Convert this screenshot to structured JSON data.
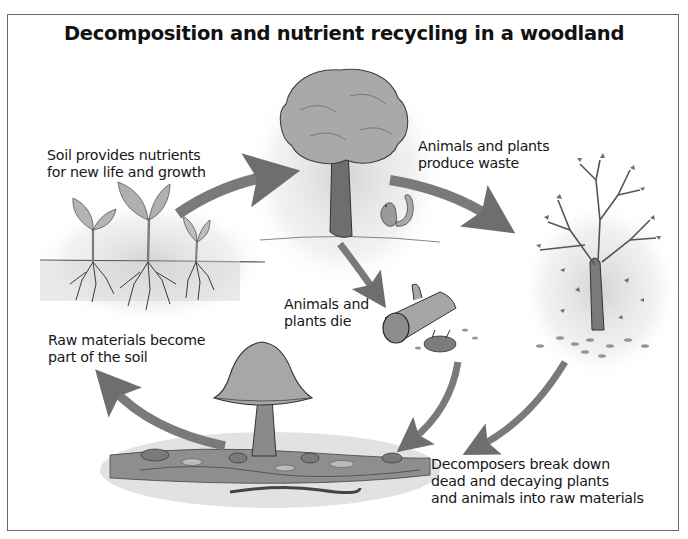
{
  "diagram": {
    "title": "Decomposition and nutrient recycling in a woodland",
    "stages": [
      {
        "id": "soil-nutrients",
        "lines": [
          "Soil provides nutrients",
          "for new life and growth"
        ],
        "illustration": "seedlings-with-roots"
      },
      {
        "id": "produce-waste",
        "lines": [
          "Animals and plants",
          "produce waste"
        ],
        "illustration": "leafy-tree-with-squirrel"
      },
      {
        "id": "die",
        "lines": [
          "Animals and",
          "plants die"
        ],
        "illustration": "fallen-log-with-dead-hedgehog"
      },
      {
        "id": "raw-materials",
        "lines": [
          "Raw materials become",
          "part of the soil"
        ],
        "illustration": "mushroom-on-forest-floor"
      },
      {
        "id": "decomposers",
        "lines": [
          "Decomposers break down",
          "dead and decaying plants",
          "and animals into raw materials"
        ],
        "illustration": "woodlice-and-worms-in-leaf-litter"
      }
    ],
    "extra_illustrations": [
      "bare-tree-shedding-leaves"
    ],
    "arrows": [
      {
        "from": "seedlings",
        "to": "leafy-tree"
      },
      {
        "from": "leafy-tree",
        "to": "bare-tree"
      },
      {
        "from": "leafy-tree",
        "to": "fallen-log"
      },
      {
        "from": "fallen-log",
        "to": "forest-floor"
      },
      {
        "from": "bare-tree",
        "to": "forest-floor"
      },
      {
        "from": "forest-floor",
        "to": "seedlings"
      }
    ],
    "colors": {
      "arrow": "#7a7a7a",
      "border": "#6b6b6b",
      "foliage": "#a8a8a8",
      "trunk": "#6e6e6e",
      "text": "#161616"
    }
  }
}
